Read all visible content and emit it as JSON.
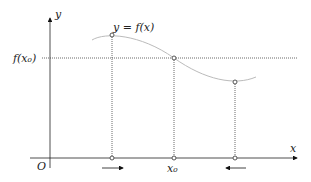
{
  "diagram": {
    "axes": {
      "x_label": "x",
      "y_label": "y",
      "origin_label": "O"
    },
    "curve_label": "y = f(x)",
    "level_label": "f(x₀)",
    "x0_label": "x₀",
    "colors": {
      "axis": "#222222",
      "curve": "#bbbbbb",
      "dotted": "#444444",
      "point": "#555555"
    },
    "arrows": [
      {
        "position": "left",
        "direction": "right"
      },
      {
        "position": "right",
        "direction": "left"
      }
    ]
  }
}
